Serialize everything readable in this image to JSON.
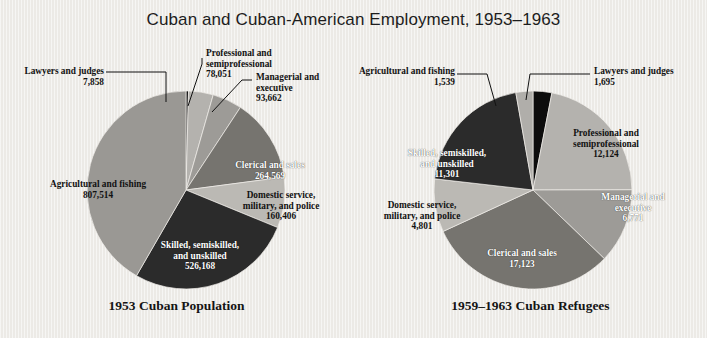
{
  "title": "Cuban and Cuban-American Employment, 1953–1963",
  "chart_data": {
    "type": "pie",
    "title": "Cuban and Cuban-American Employment, 1953–1963",
    "legend": "none",
    "charts": [
      {
        "caption": "1953 Cuban Population",
        "total": 1938228,
        "start_angle_deg": 0,
        "direction": "clockwise",
        "slices": [
          {
            "label": "Lawyers and judges",
            "value": 7858,
            "value_text": "7,858",
            "color": "#0d0d0d"
          },
          {
            "label": "Professional and semiprofessional",
            "label_line1": "Professional and",
            "label_line2": "semiprofessional",
            "value": 78051,
            "value_text": "78,051",
            "color": "#b4b2ae"
          },
          {
            "label": "Managerial and executive",
            "label_line1": "Managerial and",
            "label_line2": "executive",
            "value": 93662,
            "value_text": "93,662",
            "color": "#9d9b97"
          },
          {
            "label": "Clerical and sales",
            "value": 264569,
            "value_text": "264,569",
            "color": "#76746f"
          },
          {
            "label": "Domestic service, military, and police",
            "label_line1": "Domestic service,",
            "label_line2": "military, and police",
            "value": 160406,
            "value_text": "160,406",
            "color": "#bbb9b4"
          },
          {
            "label": "Skilled, semiskilled, and unskilled",
            "label_line1": "Skilled, semiskilled,",
            "label_line2": "and unskilled",
            "value": 526168,
            "value_text": "526,168",
            "color": "#2b2b2b"
          },
          {
            "label": "Agricultural and fishing",
            "value": 807514,
            "value_text": "807,514",
            "color": "#9a9894"
          }
        ]
      },
      {
        "caption": "1959–1963 Cuban Refugees",
        "total": 55354,
        "start_angle_deg": 0,
        "direction": "clockwise",
        "slices": [
          {
            "label": "Lawyers and judges",
            "value": 1695,
            "value_text": "1,695",
            "color": "#0d0d0d"
          },
          {
            "label": "Professional and semiprofessional",
            "label_line1": "Professional and",
            "label_line2": "semiprofessional",
            "value": 12124,
            "value_text": "12,124",
            "color": "#b4b2ae"
          },
          {
            "label": "Managerial and executive",
            "label_line1": "Managerial and",
            "label_line2": "executive",
            "value": 6771,
            "value_text": "6,771",
            "color": "#9d9b97"
          },
          {
            "label": "Clerical and sales",
            "value": 17123,
            "value_text": "17,123",
            "color": "#76746f"
          },
          {
            "label": "Domestic service, military, and police",
            "label_line1": "Domestic service,",
            "label_line2": "military, and police",
            "value": 4801,
            "value_text": "4,801",
            "color": "#bbb9b4"
          },
          {
            "label": "Skilled, semiskilled, and unskilled",
            "label_line1": "Skilled, semiskilled,",
            "label_line2": "and unskilled",
            "value": 11301,
            "value_text": "11,301",
            "color": "#2b2b2b"
          },
          {
            "label": "Agricultural and fishing",
            "value": 1539,
            "value_text": "1,539",
            "color": "#b0aeaa"
          }
        ]
      }
    ]
  },
  "left": {
    "caption": "1953 Cuban Population",
    "labels": {
      "lawyers": {
        "name": "Lawyers and judges",
        "value": "7,858"
      },
      "professional": {
        "l1": "Professional and",
        "l2": "semiprofessional",
        "value": "78,051"
      },
      "managerial": {
        "l1": "Managerial and",
        "l2": "executive",
        "value": "93,662"
      },
      "clerical": {
        "name": "Clerical and sales",
        "value": "264,569"
      },
      "domestic": {
        "l1": "Domestic service,",
        "l2": "military, and police",
        "value": "160,406"
      },
      "skilled": {
        "l1": "Skilled, semiskilled,",
        "l2": "and unskilled",
        "value": "526,168"
      },
      "agricultural": {
        "name": "Agricultural and fishing",
        "value": "807,514"
      }
    }
  },
  "right": {
    "caption": "1959–1963 Cuban Refugees",
    "labels": {
      "agricultural": {
        "name": "Agricultural and fishing",
        "value": "1,539"
      },
      "lawyers": {
        "name": "Lawyers and judges",
        "value": "1,695"
      },
      "professional": {
        "l1": "Professional and",
        "l2": "semiprofessional",
        "value": "12,124"
      },
      "managerial": {
        "l1": "Managerial and",
        "l2": "executive",
        "value": "6,771"
      },
      "clerical": {
        "name": "Clerical and sales",
        "value": "17,123"
      },
      "domestic": {
        "l1": "Domestic service,",
        "l2": "military, and police",
        "value": "4,801"
      },
      "skilled": {
        "l1": "Skilled, semiskilled,",
        "l2": "and unskilled",
        "value": "11,301"
      }
    }
  }
}
